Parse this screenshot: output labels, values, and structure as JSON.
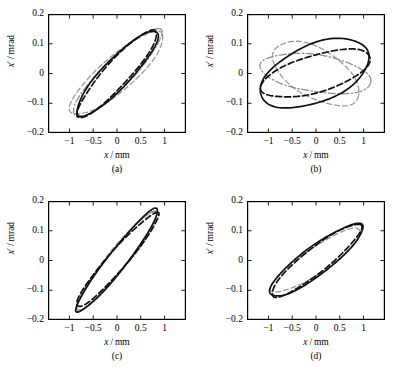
{
  "figure": {
    "background": "#ffffff",
    "axis_color": "#000000",
    "panel_count": 4
  },
  "axes": {
    "xlabel": "x/mm",
    "ylabel": "x′ / mrad",
    "xticks": [
      "−1",
      "−0.5",
      "0",
      "0.5",
      "1"
    ],
    "xtick_values": [
      -1,
      -0.5,
      0,
      0.5,
      1
    ],
    "yticks": [
      "0.2",
      "0.1",
      "0",
      "−0.1",
      "−0.2"
    ],
    "ytick_values": [
      0.2,
      0.1,
      0,
      -0.1,
      -0.2
    ],
    "xlim": [
      -1.45,
      1.45
    ],
    "ylim": [
      -0.2,
      0.2
    ],
    "grid": false
  },
  "panels": [
    {
      "id": "a",
      "label": "(a)"
    },
    {
      "id": "b",
      "label": "(b)"
    },
    {
      "id": "c",
      "label": "(c)"
    },
    {
      "id": "d",
      "label": "(d)"
    }
  ],
  "styles": {
    "black_solid": {
      "color": "#111111",
      "width": 1.7,
      "dash": "none"
    },
    "black_dashed": {
      "color": "#111111",
      "width": 1.7,
      "dash": "6,3"
    },
    "gray_dashed": {
      "color": "#9a9a9a",
      "width": 1.3,
      "dash": "5,3"
    },
    "gray_dashdot": {
      "color": "#8f8f8f",
      "width": 1.3,
      "dash": "7,2.5,1.5,2.5"
    }
  },
  "chart_data": {
    "type": "scatter",
    "title": "",
    "xlabel": "x/mm",
    "ylabel": "x′ / mrad",
    "xlim": [
      -1.45,
      1.45
    ],
    "ylim": [
      -0.2,
      0.2
    ],
    "grid": false,
    "legend_position": "none",
    "subplots": [
      {
        "panel": "(a)",
        "series": [
          {
            "name": "black-solid",
            "style": "black_solid",
            "ellipse": {
              "cx": 0.0,
              "cy": 0.0,
              "semi_major": 1.22,
              "semi_minor": 0.3,
              "angle_deg": 47.5,
              "x_extent": [
                -1.05,
                1.05
              ],
              "y_extent": [
                -0.128,
                0.128
              ]
            }
          },
          {
            "name": "black-dashed",
            "style": "black_dashed",
            "ellipse": {
              "cx": 0.0,
              "cy": 0.0,
              "semi_major": 1.24,
              "semi_minor": 0.26,
              "angle_deg": 49.0,
              "x_extent": [
                -1.0,
                1.0
              ],
              "y_extent": [
                -0.132,
                0.132
              ]
            }
          },
          {
            "name": "gray-dashed",
            "style": "gray_dashed",
            "ellipse": {
              "cx": 0.0,
              "cy": 0.0,
              "semi_major": 1.28,
              "semi_minor": 0.36,
              "angle_deg": 42.0,
              "x_extent": [
                -1.15,
                1.15
              ],
              "y_extent": [
                -0.105,
                0.105
              ]
            }
          },
          {
            "name": "gray-dashdot",
            "style": "gray_dashdot",
            "ellipse": {
              "cx": 0.0,
              "cy": 0.0,
              "semi_major": 1.3,
              "semi_minor": 0.3,
              "angle_deg": 46.0,
              "x_extent": [
                -1.12,
                1.12
              ],
              "y_extent": [
                -0.127,
                0.127
              ]
            }
          }
        ]
      },
      {
        "panel": "(b)",
        "series": [
          {
            "name": "black-solid",
            "style": "black_solid",
            "ellipse": {
              "cx": -0.02,
              "cy": 0.0,
              "semi_major": 1.22,
              "semi_minor": 0.62,
              "angle_deg": 24.0,
              "x_extent": [
                -1.18,
                1.18
              ],
              "y_extent": [
                -0.138,
                0.138
              ]
            }
          },
          {
            "name": "black-dashed",
            "style": "black_dashed",
            "ellipse": {
              "cx": 0.0,
              "cy": 0.0,
              "semi_major": 1.2,
              "semi_minor": 0.4,
              "angle_deg": 17.0,
              "x_extent": [
                -1.12,
                1.12
              ],
              "y_extent": [
                -0.098,
                0.098
              ]
            }
          },
          {
            "name": "gray-dashed",
            "style": "gray_dashed",
            "ellipse": {
              "cx": 0.0,
              "cy": 0.0,
              "semi_major": 1.02,
              "semi_minor": 0.52,
              "angle_deg": -32.0,
              "x_extent": [
                -0.95,
                0.95
              ],
              "y_extent": [
                -0.118,
                0.118
              ]
            }
          },
          {
            "name": "gray-dashdot",
            "style": "gray_dashdot",
            "ellipse": {
              "cx": 0.0,
              "cy": 0.0,
              "semi_major": 1.18,
              "semi_minor": 0.4,
              "angle_deg": -9.0,
              "x_extent": [
                -1.15,
                1.15
              ],
              "y_extent": [
                -0.082,
                0.082
              ]
            }
          }
        ]
      },
      {
        "panel": "(c)",
        "series": [
          {
            "name": "black-solid",
            "style": "black_solid",
            "ellipse": {
              "cx": 0.0,
              "cy": 0.0,
              "semi_major": 1.4,
              "semi_minor": 0.2,
              "angle_deg": 53.0,
              "x_extent": [
                -1.05,
                1.05
              ],
              "y_extent": [
                -0.178,
                0.178
              ]
            }
          },
          {
            "name": "black-dashed",
            "style": "black_dashed",
            "ellipse": {
              "cx": 0.0,
              "cy": 0.0,
              "semi_major": 1.32,
              "semi_minor": 0.2,
              "angle_deg": 50.0,
              "x_extent": [
                -1.02,
                1.02
              ],
              "y_extent": [
                -0.138,
                0.138
              ]
            }
          },
          {
            "name": "gray-dashed",
            "style": "gray_dashed",
            "ellipse": {
              "cx": 0.0,
              "cy": 0.0,
              "semi_major": 1.34,
              "semi_minor": 0.22,
              "angle_deg": 52.0,
              "x_extent": [
                -1.0,
                1.0
              ],
              "y_extent": [
                -0.16,
                0.16
              ]
            }
          },
          {
            "name": "gray-dashdot",
            "style": "gray_dashdot",
            "ellipse": {
              "cx": 0.0,
              "cy": 0.0,
              "semi_major": 1.36,
              "semi_minor": 0.2,
              "angle_deg": 52.5,
              "x_extent": [
                -1.02,
                1.02
              ],
              "y_extent": [
                -0.168,
                0.168
              ]
            }
          }
        ]
      },
      {
        "panel": "(d)",
        "series": [
          {
            "name": "black-solid",
            "style": "black_solid",
            "ellipse": {
              "cx": 0.0,
              "cy": 0.0,
              "semi_major": 1.22,
              "semi_minor": 0.3,
              "angle_deg": 38.0,
              "x_extent": [
                -1.08,
                1.08
              ],
              "y_extent": [
                -0.095,
                0.095
              ]
            }
          },
          {
            "name": "black-dashed",
            "style": "black_dashed",
            "ellipse": {
              "cx": 0.0,
              "cy": 0.0,
              "semi_major": 1.2,
              "semi_minor": 0.26,
              "angle_deg": 39.5,
              "x_extent": [
                -1.02,
                1.02
              ],
              "y_extent": [
                -0.095,
                0.095
              ]
            }
          },
          {
            "name": "gray-dashed",
            "style": "gray_dashed",
            "ellipse": {
              "cx": 0.0,
              "cy": 0.0,
              "semi_major": 1.14,
              "semi_minor": 0.27,
              "angle_deg": 35.0,
              "x_extent": [
                -1.0,
                1.0
              ],
              "y_extent": [
                -0.082,
                0.082
              ]
            }
          }
        ]
      }
    ]
  }
}
